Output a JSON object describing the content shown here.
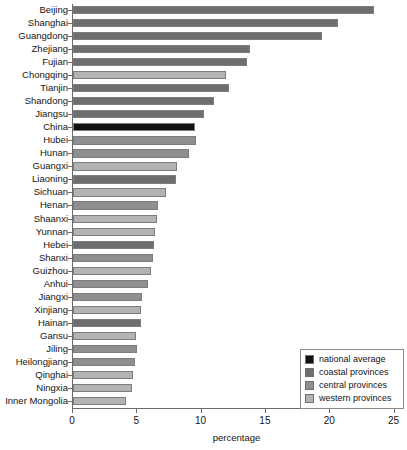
{
  "chart_data": {
    "type": "bar",
    "orientation": "horizontal",
    "title": "",
    "xlabel": "percentage",
    "ylabel": "",
    "xlim": [
      0,
      25
    ],
    "xticks": [
      0,
      5,
      10,
      15,
      20,
      25
    ],
    "grid": false,
    "legend_position": "bottom-right",
    "categories": [
      "Beijing",
      "Shanghai",
      "Guangdong",
      "Zhejiang",
      "Fujian",
      "Chongqing",
      "Tianjin",
      "Shandong",
      "Jiangsu",
      "China",
      "Hubei",
      "Hunan",
      "Guangxi",
      "Liaoning",
      "Sichuan",
      "Henan",
      "Shaanxi",
      "Yunnan",
      "Hebei",
      "Shanxi",
      "Guizhou",
      "Anhui",
      "Jiangxi",
      "Xinjiang",
      "Hainan",
      "Gansu",
      "Jiling",
      "Heilongjiang",
      "Qinghai",
      "Ningxia",
      "Inner Mongolia"
    ],
    "values": [
      23.4,
      20.6,
      19.4,
      13.8,
      13.5,
      11.9,
      12.1,
      11.0,
      10.2,
      9.5,
      9.6,
      9.0,
      8.1,
      8.0,
      7.2,
      6.6,
      6.5,
      6.4,
      6.3,
      6.2,
      6.1,
      5.8,
      5.4,
      5.3,
      5.3,
      4.9,
      5.0,
      4.8,
      4.7,
      4.6,
      4.1
    ],
    "groups": [
      "coastal",
      "coastal",
      "coastal",
      "coastal",
      "coastal",
      "western",
      "coastal",
      "coastal",
      "coastal",
      "national",
      "central",
      "central",
      "western",
      "coastal",
      "western",
      "central",
      "western",
      "western",
      "coastal",
      "central",
      "western",
      "central",
      "central",
      "western",
      "coastal",
      "western",
      "central",
      "central",
      "western",
      "western",
      "western"
    ],
    "series": [
      {
        "name": "percentage",
        "points": [
          {
            "category": "Beijing",
            "value": 23.4,
            "group": "coastal"
          },
          {
            "category": "Shanghai",
            "value": 20.6,
            "group": "coastal"
          },
          {
            "category": "Guangdong",
            "value": 19.4,
            "group": "coastal"
          },
          {
            "category": "Zhejiang",
            "value": 13.8,
            "group": "coastal"
          },
          {
            "category": "Fujian",
            "value": 13.5,
            "group": "coastal"
          },
          {
            "category": "Chongqing",
            "value": 11.9,
            "group": "western"
          },
          {
            "category": "Tianjin",
            "value": 12.1,
            "group": "coastal"
          },
          {
            "category": "Shandong",
            "value": 11.0,
            "group": "coastal"
          },
          {
            "category": "Jiangsu",
            "value": 10.2,
            "group": "coastal"
          },
          {
            "category": "China",
            "value": 9.5,
            "group": "national"
          },
          {
            "category": "Hubei",
            "value": 9.6,
            "group": "central"
          },
          {
            "category": "Hunan",
            "value": 9.0,
            "group": "central"
          },
          {
            "category": "Guangxi",
            "value": 8.1,
            "group": "western"
          },
          {
            "category": "Liaoning",
            "value": 8.0,
            "group": "coastal"
          },
          {
            "category": "Sichuan",
            "value": 7.2,
            "group": "western"
          },
          {
            "category": "Henan",
            "value": 6.6,
            "group": "central"
          },
          {
            "category": "Shaanxi",
            "value": 6.5,
            "group": "western"
          },
          {
            "category": "Yunnan",
            "value": 6.4,
            "group": "western"
          },
          {
            "category": "Hebei",
            "value": 6.3,
            "group": "coastal"
          },
          {
            "category": "Shanxi",
            "value": 6.2,
            "group": "central"
          },
          {
            "category": "Guizhou",
            "value": 6.1,
            "group": "western"
          },
          {
            "category": "Anhui",
            "value": 5.8,
            "group": "central"
          },
          {
            "category": "Jiangxi",
            "value": 5.4,
            "group": "central"
          },
          {
            "category": "Xinjiang",
            "value": 5.3,
            "group": "western"
          },
          {
            "category": "Hainan",
            "value": 5.3,
            "group": "coastal"
          },
          {
            "category": "Gansu",
            "value": 4.9,
            "group": "western"
          },
          {
            "category": "Jiling",
            "value": 5.0,
            "group": "central"
          },
          {
            "category": "Heilongjiang",
            "value": 4.8,
            "group": "central"
          },
          {
            "category": "Qinghai",
            "value": 4.7,
            "group": "western"
          },
          {
            "category": "Ningxia",
            "value": 4.6,
            "group": "western"
          },
          {
            "category": "Inner Mongolia",
            "value": 4.1,
            "group": "western"
          }
        ]
      }
    ]
  },
  "legend": {
    "items": [
      {
        "label": "national average",
        "group": "national",
        "color": "#111111"
      },
      {
        "label": "coastal provinces",
        "group": "coastal",
        "color": "#6e6e6e"
      },
      {
        "label": "central provinces",
        "group": "central",
        "color": "#8f8f8f"
      },
      {
        "label": "western provinces",
        "group": "western",
        "color": "#b3b3b3"
      }
    ]
  },
  "colors": {
    "national": "#111111",
    "coastal": "#6e6e6e",
    "central": "#8f8f8f",
    "western": "#b3b3b3",
    "axis": "#6b6b6b",
    "text": "#141414",
    "background": "#ffffff"
  }
}
